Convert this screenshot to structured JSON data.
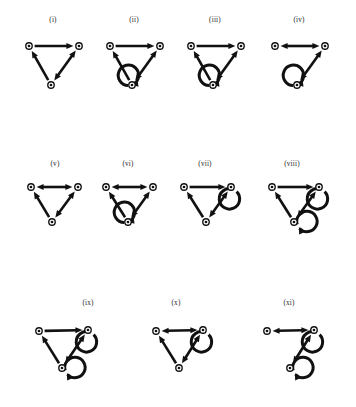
{
  "figure": {
    "title": "",
    "background_color": "#ffffff",
    "ink_color": "#111111",
    "width": 356,
    "height": 407,
    "node_glyph": "concentric-circle-node",
    "panels": [
      {
        "id": "i",
        "label": "(i)",
        "label_x": 53,
        "label_y": 22,
        "row": 1,
        "nodes": [
          {
            "name": "left",
            "cx": 29,
            "cy": 46
          },
          {
            "name": "right",
            "cx": 79,
            "cy": 46
          },
          {
            "name": "bottom",
            "cx": 51,
            "cy": 85
          }
        ],
        "edges": [
          {
            "from": "left",
            "to": "right",
            "direction": "forward"
          },
          {
            "from": "bottom",
            "to": "left",
            "direction": "forward"
          },
          {
            "from": "right",
            "to": "bottom",
            "direction": "both"
          }
        ],
        "self_loops": []
      },
      {
        "id": "ii",
        "label": "(ii)",
        "label_x": 134,
        "label_y": 22,
        "row": 1,
        "nodes": [
          {
            "name": "left",
            "cx": 110,
            "cy": 46
          },
          {
            "name": "right",
            "cx": 160,
            "cy": 46
          },
          {
            "name": "bottom",
            "cx": 132,
            "cy": 85
          }
        ],
        "edges": [
          {
            "from": "left",
            "to": "right",
            "direction": "forward"
          },
          {
            "from": "bottom",
            "to": "left",
            "direction": "forward"
          },
          {
            "from": "right",
            "to": "bottom",
            "direction": "both"
          }
        ],
        "self_loops": [
          {
            "node": "bottom",
            "position": "below"
          }
        ]
      },
      {
        "id": "iii",
        "label": "(iii)",
        "label_x": 215,
        "label_y": 22,
        "row": 1,
        "nodes": [
          {
            "name": "left",
            "cx": 191,
            "cy": 46
          },
          {
            "name": "right",
            "cx": 241,
            "cy": 46
          },
          {
            "name": "bottom",
            "cx": 213,
            "cy": 85
          }
        ],
        "edges": [
          {
            "from": "left",
            "to": "right",
            "direction": "forward"
          },
          {
            "from": "bottom",
            "to": "left",
            "direction": "forward"
          },
          {
            "from": "right",
            "to": "bottom",
            "direction": "both"
          }
        ],
        "self_loops": [
          {
            "node": "bottom",
            "position": "below"
          }
        ]
      },
      {
        "id": "iv",
        "label": "(iv)",
        "label_x": 299,
        "label_y": 22,
        "row": 1,
        "nodes": [
          {
            "name": "left",
            "cx": 275,
            "cy": 46
          },
          {
            "name": "right",
            "cx": 325,
            "cy": 46
          },
          {
            "name": "bottom",
            "cx": 297,
            "cy": 85
          }
        ],
        "edges": [
          {
            "from": "left",
            "to": "right",
            "direction": "both"
          },
          {
            "from": "right",
            "to": "bottom",
            "direction": "both"
          }
        ],
        "self_loops": [
          {
            "node": "bottom",
            "position": "below"
          }
        ]
      },
      {
        "id": "v",
        "label": "(v)",
        "label_x": 55,
        "label_y": 166,
        "row": 2,
        "nodes": [
          {
            "name": "left",
            "cx": 31,
            "cy": 187
          },
          {
            "name": "right",
            "cx": 78,
            "cy": 187
          },
          {
            "name": "bottom",
            "cx": 52,
            "cy": 222
          }
        ],
        "edges": [
          {
            "from": "left",
            "to": "right",
            "direction": "both"
          },
          {
            "from": "bottom",
            "to": "left",
            "direction": "forward"
          },
          {
            "from": "right",
            "to": "bottom",
            "direction": "both"
          }
        ],
        "self_loops": []
      },
      {
        "id": "vi",
        "label": "(vi)",
        "label_x": 128,
        "label_y": 166,
        "row": 2,
        "nodes": [
          {
            "name": "left",
            "cx": 106,
            "cy": 187
          },
          {
            "name": "right",
            "cx": 153,
            "cy": 187
          },
          {
            "name": "bottom",
            "cx": 128,
            "cy": 222
          }
        ],
        "edges": [
          {
            "from": "left",
            "to": "right",
            "direction": "both"
          },
          {
            "from": "bottom",
            "to": "left",
            "direction": "forward"
          },
          {
            "from": "right",
            "to": "bottom",
            "direction": "both"
          }
        ],
        "self_loops": [
          {
            "node": "bottom",
            "position": "below"
          }
        ]
      },
      {
        "id": "vii",
        "label": "(vii)",
        "label_x": 205,
        "label_y": 166,
        "row": 2,
        "nodes": [
          {
            "name": "left",
            "cx": 184,
            "cy": 187
          },
          {
            "name": "right",
            "cx": 231,
            "cy": 187
          },
          {
            "name": "bottom",
            "cx": 206,
            "cy": 222
          }
        ],
        "edges": [
          {
            "from": "left",
            "to": "right",
            "direction": "forward"
          },
          {
            "from": "bottom",
            "to": "left",
            "direction": "forward"
          },
          {
            "from": "right",
            "to": "bottom",
            "direction": "both"
          }
        ],
        "self_loops": [
          {
            "node": "right",
            "position": "upper-right"
          }
        ]
      },
      {
        "id": "viii",
        "label": "(viii)",
        "label_x": 292,
        "label_y": 166,
        "row": 2,
        "nodes": [
          {
            "name": "left",
            "cx": 272,
            "cy": 187
          },
          {
            "name": "right",
            "cx": 319,
            "cy": 187
          },
          {
            "name": "bottom",
            "cx": 294,
            "cy": 222
          }
        ],
        "edges": [
          {
            "from": "left",
            "to": "right",
            "direction": "forward"
          },
          {
            "from": "bottom",
            "to": "left",
            "direction": "forward"
          },
          {
            "from": "right",
            "to": "bottom",
            "direction": "both"
          }
        ],
        "self_loops": [
          {
            "node": "right",
            "position": "upper-right"
          },
          {
            "node": "bottom",
            "position": "below-left"
          }
        ]
      },
      {
        "id": "ix",
        "label": "(ix)",
        "label_x": 88,
        "label_y": 305,
        "row": 3,
        "nodes": [
          {
            "name": "left",
            "cx": 39,
            "cy": 331
          },
          {
            "name": "right",
            "cx": 88,
            "cy": 330
          },
          {
            "name": "bottom",
            "cx": 62,
            "cy": 368
          }
        ],
        "edges": [
          {
            "from": "left",
            "to": "right",
            "direction": "forward"
          },
          {
            "from": "bottom",
            "to": "left",
            "direction": "forward"
          },
          {
            "from": "right",
            "to": "bottom",
            "direction": "both"
          }
        ],
        "self_loops": [
          {
            "node": "right",
            "position": "upper-right"
          },
          {
            "node": "bottom",
            "position": "below-left"
          }
        ]
      },
      {
        "id": "x",
        "label": "(x)",
        "label_x": 176,
        "label_y": 305,
        "row": 3,
        "nodes": [
          {
            "name": "left",
            "cx": 156,
            "cy": 331
          },
          {
            "name": "right",
            "cx": 203,
            "cy": 330
          },
          {
            "name": "bottom",
            "cx": 179,
            "cy": 368
          }
        ],
        "edges": [
          {
            "from": "left",
            "to": "right",
            "direction": "both"
          },
          {
            "from": "bottom",
            "to": "left",
            "direction": "forward"
          },
          {
            "from": "right",
            "to": "bottom",
            "direction": "both"
          }
        ],
        "self_loops": [
          {
            "node": "right",
            "position": "upper-right"
          }
        ]
      },
      {
        "id": "xi",
        "label": "(xi)",
        "label_x": 289,
        "label_y": 305,
        "row": 3,
        "nodes": [
          {
            "name": "left",
            "cx": 267,
            "cy": 331
          },
          {
            "name": "right",
            "cx": 314,
            "cy": 330
          },
          {
            "name": "bottom",
            "cx": 290,
            "cy": 368
          }
        ],
        "edges": [
          {
            "from": "left",
            "to": "right",
            "direction": "both"
          },
          {
            "from": "right",
            "to": "bottom",
            "direction": "both"
          }
        ],
        "self_loops": [
          {
            "node": "right",
            "position": "upper-right"
          },
          {
            "node": "bottom",
            "position": "below-left"
          }
        ]
      }
    ]
  }
}
